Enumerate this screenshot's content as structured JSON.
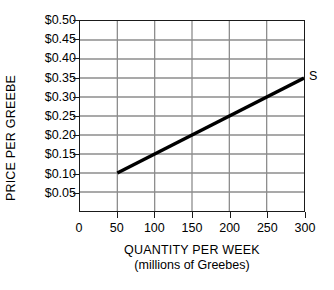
{
  "chart_data": {
    "type": "line",
    "title": "",
    "xlabel": "QUANTITY PER WEEK",
    "xlabel_sub": "(millions of Greebes)",
    "ylabel": "PRICE PER GREEBE",
    "xlim": [
      0,
      300
    ],
    "ylim": [
      0,
      0.5
    ],
    "grid": true,
    "legend_position": "inline-right-end",
    "x_ticks": [
      0,
      50,
      100,
      150,
      200,
      250,
      300
    ],
    "x_tick_labels": [
      "0",
      "50",
      "100",
      "150",
      "200",
      "250",
      "300"
    ],
    "y_ticks": [
      0.05,
      0.1,
      0.15,
      0.2,
      0.25,
      0.3,
      0.35,
      0.4,
      0.45,
      0.5
    ],
    "y_tick_labels": [
      "$0.05",
      "$0.10",
      "$0.15",
      "$0.20",
      "$0.25",
      "$0.30",
      "$0.35",
      "$0.40",
      "$0.45",
      "$0.50"
    ],
    "series": [
      {
        "name": "S",
        "label": "S",
        "x": [
          50,
          300
        ],
        "y": [
          0.1,
          0.35
        ],
        "points": [
          {
            "x": 50,
            "y": 0.1
          },
          {
            "x": 300,
            "y": 0.35
          }
        ],
        "color": "#000000",
        "width": 3.4
      }
    ],
    "annotations": [
      {
        "text": "S",
        "x": 300,
        "y": 0.35,
        "placement": "right"
      }
    ]
  },
  "colors": {
    "grid": "#8c8c8c",
    "axis": "#1a1a1a",
    "series": "#000000",
    "background": "#ffffff",
    "text": "#000000"
  }
}
